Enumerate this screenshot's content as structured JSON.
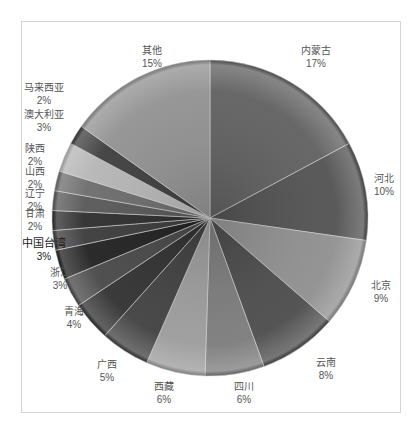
{
  "chart_data": {
    "type": "pie",
    "title": "",
    "start_angle_deg": 0,
    "direction": "clockwise",
    "categories": [
      "内蒙古",
      "河北",
      "北京",
      "云南",
      "四川",
      "西藏",
      "广西",
      "青海",
      "浙江",
      "中国台湾",
      "甘肃",
      "辽宁",
      "山西",
      "陕西",
      "澳大利亚",
      "马来西亚",
      "其他"
    ],
    "values": [
      17,
      10,
      9,
      8,
      6,
      6,
      5,
      4,
      3,
      3,
      2,
      2,
      2,
      2,
      3,
      2,
      15
    ],
    "labels": [
      "17%",
      "10%",
      "9%",
      "8%",
      "6%",
      "6%",
      "5%",
      "4%",
      "3%",
      "3%",
      "2%",
      "2%",
      "2%",
      "2%",
      "3%",
      "2%",
      "15%"
    ],
    "colors": [
      "#5e5e5e",
      "#505050",
      "#8e8e8e",
      "#4a4a4a",
      "#7a7a7a",
      "#9a9a9a",
      "#3e3e3e",
      "#2e2e2e",
      "#454545",
      "#1e1e1e",
      "#383838",
      "#2a2a2a",
      "#555555",
      "#6a6a6a",
      "#b4b4b4",
      "#3c3c3c",
      "#909090"
    ],
    "label_positions": [
      [
        316,
        57
      ],
      [
        384,
        185
      ],
      [
        381,
        292
      ],
      [
        326,
        369
      ],
      [
        244,
        393
      ],
      [
        164,
        393
      ],
      [
        107,
        371
      ],
      [
        74,
        318
      ],
      [
        60,
        279
      ],
      [
        44,
        250
      ],
      [
        35,
        220
      ],
      [
        35,
        200
      ],
      [
        35,
        178
      ],
      [
        35,
        155
      ],
      [
        44,
        121
      ],
      [
        44,
        94
      ],
      [
        152,
        57
      ]
    ],
    "legend": "none",
    "data_labels": "category name + percentage, outside end"
  },
  "caption": {
    "text": ""
  }
}
